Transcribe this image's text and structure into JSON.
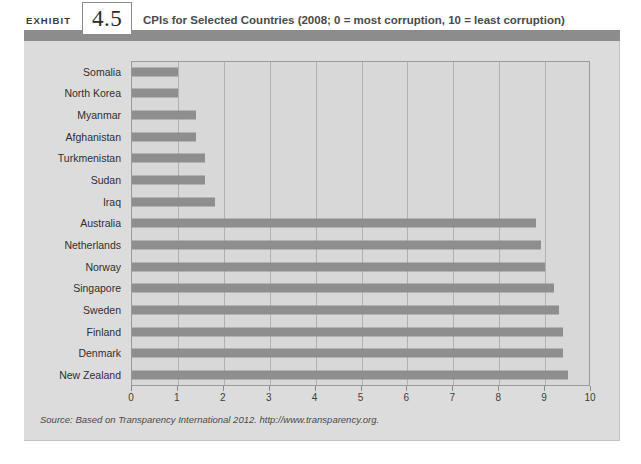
{
  "exhibit": {
    "label": "EXHIBIT",
    "number": "4.5",
    "title": "CPIs for Selected Countries (2008; 0 = most corruption, 10 = least corruption)"
  },
  "source": {
    "text": "Source: Based on Transparency International 2012. http://www.transparency.org."
  },
  "colors": {
    "band": "#8c8c8c",
    "panel_bg": "#dcdcdc",
    "plot_bg": "#d8d8d8",
    "bar": "#8e8e8e",
    "gridline": "#b0b0b0",
    "plot_border": "#9a9a9a",
    "text": "#2f2f2f"
  },
  "chart_data": {
    "type": "bar",
    "orientation": "horizontal",
    "title": "CPIs for Selected Countries (2008; 0 = most corruption, 10 = least corruption)",
    "xlabel": "",
    "ylabel": "",
    "xlim": [
      0,
      10
    ],
    "xticks": [
      "0",
      "1",
      "2",
      "3",
      "4",
      "5",
      "6",
      "7",
      "8",
      "9",
      "10"
    ],
    "grid": true,
    "legend": "none",
    "categories": [
      "Somalia",
      "North Korea",
      "Myanmar",
      "Afghanistan",
      "Turkmenistan",
      "Sudan",
      "Iraq",
      "Australia",
      "Netherlands",
      "Norway",
      "Singapore",
      "Sweden",
      "Finland",
      "Denmark",
      "New Zealand"
    ],
    "values": [
      1.0,
      1.0,
      1.4,
      1.4,
      1.6,
      1.6,
      1.8,
      8.8,
      8.9,
      9.0,
      9.2,
      9.3,
      9.4,
      9.4,
      9.5
    ]
  }
}
